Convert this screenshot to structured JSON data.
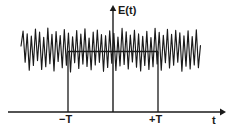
{
  "figure": {
    "title_visible": false,
    "background_color": "#ffffff",
    "stroke_color": "#1a1a1a",
    "labels": {
      "y_axis": "E(t)",
      "x_axis": "t",
      "left_marker": "−T",
      "right_marker": "+T"
    }
  },
  "chart_data": {
    "type": "line",
    "title": "",
    "xlabel": "t",
    "ylabel": "E(t)",
    "grid": false,
    "legend": "none",
    "axes": {
      "x_axis_y_pixel": 112,
      "y_axis_x_pixel": 113,
      "x_axis_arrow": true,
      "y_axis_arrow": true,
      "xlim": [
        -2.4,
        2.4
      ],
      "ylim": [
        -1.5,
        1.5
      ]
    },
    "annotations": [
      {
        "name": "marker-minus-T",
        "label": "−T",
        "x": -1.0,
        "type": "vertical-line",
        "from_y": 0.0,
        "to_y": -1.35
      },
      {
        "name": "marker-plus-T",
        "label": "+T",
        "x": 1.0,
        "type": "vertical-line",
        "from_y": 0.0,
        "to_y": -1.35
      },
      {
        "name": "window-baseline",
        "label": "",
        "type": "horizontal-line",
        "from_x": -1.0,
        "to_x": 1.0,
        "y": 0.0
      }
    ],
    "series": [
      {
        "name": "E(t)",
        "description": "noisy quasi-periodic oscillating field",
        "color": "#1a1a1a",
        "x": [
          -2.23,
          -2.18,
          -2.13,
          -2.08,
          -2.03,
          -1.98,
          -1.93,
          -1.88,
          -1.83,
          -1.78,
          -1.73,
          -1.68,
          -1.63,
          -1.58,
          -1.53,
          -1.48,
          -1.43,
          -1.38,
          -1.33,
          -1.28,
          -1.23,
          -1.18,
          -1.13,
          -1.08,
          -1.03,
          -0.98,
          -0.93,
          -0.88,
          -0.83,
          -0.78,
          -0.73,
          -0.68,
          -0.63,
          -0.58,
          -0.53,
          -0.48,
          -0.43,
          -0.38,
          -0.33,
          -0.28,
          -0.23,
          -0.18,
          -0.13,
          -0.08,
          -0.03,
          0.02,
          0.07,
          0.12,
          0.17,
          0.22,
          0.27,
          0.32,
          0.37,
          0.42,
          0.47,
          0.52,
          0.57,
          0.62,
          0.67,
          0.72,
          0.77,
          0.82,
          0.87,
          0.92,
          0.97,
          1.02,
          1.07,
          1.12,
          1.17,
          1.22,
          1.27,
          1.32,
          1.37,
          1.42,
          1.47,
          1.52,
          1.57,
          1.62,
          1.67,
          1.72,
          1.77,
          1.82,
          1.87,
          1.92,
          1.97,
          2.02,
          2.07,
          2.12
        ],
        "values": [
          0.18,
          0.86,
          -0.55,
          0.74,
          -0.92,
          0.63,
          -0.7,
          0.95,
          -0.48,
          0.82,
          -0.88,
          0.58,
          -0.76,
          1.0,
          -0.62,
          0.71,
          -0.95,
          0.84,
          -0.52,
          0.66,
          -0.8,
          0.93,
          -0.69,
          0.77,
          -1.0,
          0.6,
          -0.58,
          0.88,
          -0.84,
          0.72,
          -0.64,
          0.96,
          -0.75,
          0.54,
          -0.9,
          0.81,
          -0.68,
          0.91,
          -0.56,
          0.7,
          -0.97,
          0.65,
          -0.79,
          0.87,
          -0.6,
          0.76,
          -0.93,
          0.59,
          -0.72,
          0.98,
          -0.66,
          0.83,
          -0.86,
          0.68,
          -0.54,
          0.9,
          -0.78,
          0.73,
          -0.95,
          0.62,
          -0.7,
          0.85,
          -0.88,
          0.57,
          -0.76,
          0.99,
          -0.63,
          0.8,
          -0.92,
          0.67,
          -0.58,
          0.94,
          -0.82,
          0.71,
          -0.69,
          0.89,
          -0.55,
          0.78,
          -0.96,
          0.64,
          -0.74,
          0.87,
          -0.86,
          0.61,
          -0.68,
          0.92,
          -0.8,
          0.2
        ]
      }
    ]
  }
}
